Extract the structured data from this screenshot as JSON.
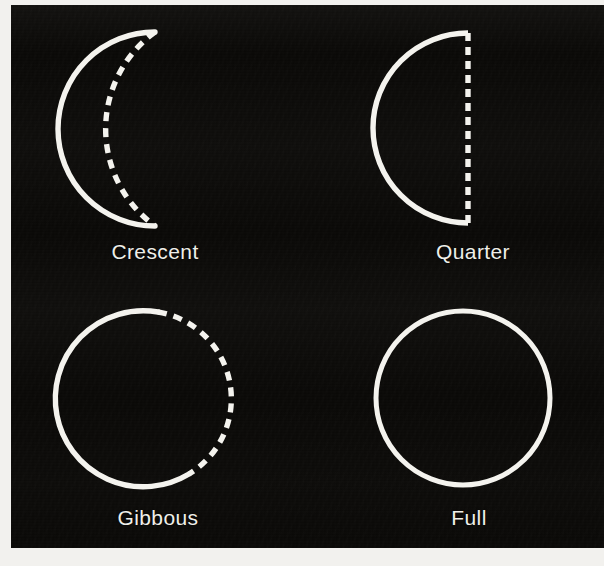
{
  "figure": {
    "background_color": "#0a0907",
    "stroke_color": "#f4f3ee",
    "label_color": "#efefe9",
    "page_color": "#f2f1ee"
  },
  "diagram_data": {
    "type": "diagram",
    "subject": "moon-phases",
    "illuminated_side": "left",
    "stroke_width_px": 5,
    "legend": {
      "solid_line": "lit limb of the Moon",
      "dashed_line": "terminator / unlit limb"
    },
    "phases": [
      {
        "id": "crescent",
        "label": "Crescent",
        "row": 0,
        "column": 0,
        "center": {
          "x": 149,
          "y": 129
        },
        "radius": 97,
        "solid_arc_degrees": 180,
        "dashed_arc_degrees": 180,
        "dashed_bulge_radius": 36,
        "illuminated_fraction": 0.18,
        "label_position": {
          "x": 155,
          "y": 240
        }
      },
      {
        "id": "quarter",
        "label": "Quarter",
        "row": 0,
        "column": 1,
        "center": {
          "x": 468,
          "y": 128
        },
        "radius": 95,
        "solid_arc_degrees": 180,
        "dashed_arc_degrees": 0,
        "dashed_is_straight_terminator": true,
        "illuminated_fraction": 0.5,
        "label_position": {
          "x": 473,
          "y": 240
        }
      },
      {
        "id": "gibbous",
        "label": "Gibbous",
        "row": 1,
        "column": 0,
        "center": {
          "x": 143,
          "y": 399
        },
        "radius": 88,
        "solid_arc_degrees": 212,
        "dashed_arc_degrees": 148,
        "illuminated_fraction": 0.78,
        "label_position": {
          "x": 158,
          "y": 506
        }
      },
      {
        "id": "full",
        "label": "Full",
        "row": 1,
        "column": 1,
        "center": {
          "x": 463,
          "y": 398
        },
        "radius": 87,
        "solid_arc_degrees": 360,
        "dashed_arc_degrees": 0,
        "illuminated_fraction": 1.0,
        "label_position": {
          "x": 469,
          "y": 506
        }
      }
    ]
  }
}
